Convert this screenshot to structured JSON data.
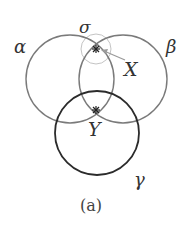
{
  "diagram": {
    "caption": "(a)",
    "circles": [
      {
        "id": "alpha",
        "label": "α",
        "cx": 70,
        "cy": 79,
        "r": 44,
        "color": "#7a7a7a",
        "stroke_width": 1.4
      },
      {
        "id": "beta",
        "label": "β",
        "cx": 123,
        "cy": 79,
        "r": 44,
        "color": "#7a7a7a",
        "stroke_width": 1.4
      },
      {
        "id": "gamma",
        "label": "γ",
        "cx": 97,
        "cy": 133,
        "r": 42,
        "color": "#2b2b2b",
        "stroke_width": 1.8
      },
      {
        "id": "sigma",
        "label": "σ",
        "cx": 96,
        "cy": 49,
        "r": 15,
        "color": "#bdbdbd",
        "stroke_width": 1.0
      }
    ],
    "points": [
      {
        "id": "X",
        "label": "X",
        "x": 96,
        "y": 49
      },
      {
        "id": "Y",
        "label": "Y",
        "x": 96,
        "y": 110
      }
    ],
    "labels": {
      "alpha": "α",
      "beta": "β",
      "gamma": "γ",
      "sigma": "σ",
      "X": "X",
      "Y": "Y"
    }
  }
}
